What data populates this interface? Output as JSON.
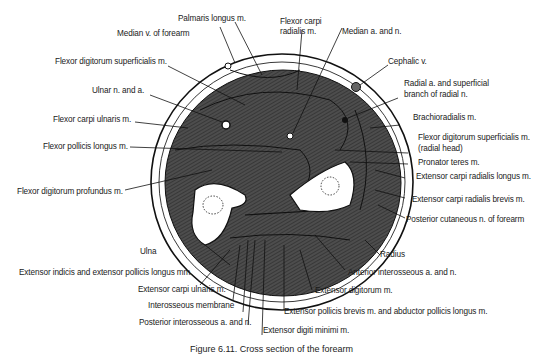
{
  "figure": {
    "title": "Cross section of the forearm",
    "caption": "Figure 6.11. Cross section of the forearm"
  },
  "labels": {
    "palmaris_longus": "Palmaris longus m.",
    "median_v_forearm": "Median v. of forearm",
    "fds": "Flexor digitorum superficialis m.",
    "ulnar_n_a": "Ulnar n. and a.",
    "fcu": "Flexor carpi ulnaris m.",
    "fpl": "Flexor pollicis longus m.",
    "fdp": "Flexor digitorum profundus m.",
    "fcr_1": "Flexor carpi",
    "fcr_2": "radialis m.",
    "median_a_n": "Median a. and n.",
    "cephalic_v": "Cephalic v.",
    "radial_a_1": "Radial a. and superficial",
    "radial_a_2": "branch of radial n.",
    "brachioradialis": "Brachioradialis m.",
    "fds_radial_1": "Flexor digitorum superficialis m.",
    "fds_radial_2": "(radial head)",
    "pronator_teres": "Pronator teres m.",
    "ecrl": "Extensor carpi radialis longus m.",
    "ecrb": "Extensor carpi radialis brevis m.",
    "posterior_cutaneous": "Posterior cutaneous n. of forearm",
    "radius": "Radius",
    "ulna": "Ulna",
    "anterior_interosseous": "Anterior interosseous a. and n.",
    "extensor_digitorum": "Extensor digitorum m.",
    "epb_apl": "Extensor pollicis brevis m. and abductor pollicis longus m.",
    "extensor_indicis": "Extensor indicis and extensor pollicis longus mm.",
    "ecu": "Extensor carpi ulnaris m.",
    "interosseous_membrane": "Interosseous membrane",
    "posterior_interosseous": "Posterior interosseous a. and n.",
    "extensor_digiti_minimi": "Extensor digiti minimi m."
  },
  "colors": {
    "muscle": "#4a4a4a",
    "bone": "#ffffff",
    "line": "#111111",
    "background": "#ffffff"
  }
}
